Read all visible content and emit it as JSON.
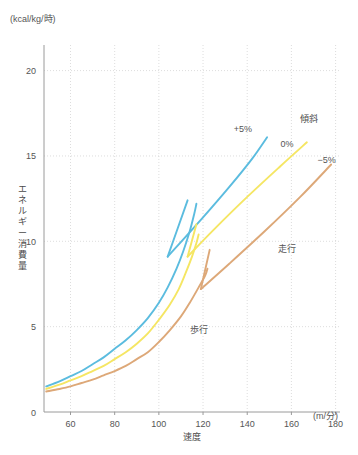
{
  "chart_data": {
    "type": "line",
    "title": "",
    "xlabel": "速度",
    "ylabel": "エネルギー消費量",
    "x_unit": "(m/分)",
    "y_unit": "(kcal/kg/時)",
    "xlim": [
      48,
      182
    ],
    "ylim": [
      0,
      21.5
    ],
    "xticks": [
      60,
      80,
      100,
      120,
      140,
      160,
      180
    ],
    "yticks": [
      0,
      5,
      10,
      15,
      20
    ],
    "grid": true,
    "legend_position": "in-plot",
    "group_label": "傾斜",
    "annotations": [
      {
        "text": "歩行",
        "x": 118,
        "y": 4.6
      },
      {
        "text": "走行",
        "x": 158,
        "y": 9.4
      },
      {
        "text": "傾斜",
        "x": 168,
        "y": 17.0
      },
      {
        "text": "+5%",
        "x": 138,
        "y": 16.4
      },
      {
        "text": "0%",
        "x": 158,
        "y": 15.5
      },
      {
        "text": "−5%",
        "x": 176,
        "y": 14.6
      }
    ],
    "series": [
      {
        "name": "+5%",
        "incline": "+5%",
        "color": "#5bbcdf",
        "walk": {
          "label": "歩行",
          "x": [
            49,
            55,
            60,
            65,
            70,
            75,
            80,
            85,
            90,
            95,
            100,
            104,
            108,
            111,
            114,
            116,
            117
          ],
          "y": [
            1.5,
            1.8,
            2.1,
            2.4,
            2.8,
            3.2,
            3.7,
            4.2,
            4.8,
            5.5,
            6.4,
            7.3,
            8.4,
            9.4,
            10.6,
            11.6,
            12.2
          ]
        },
        "run": {
          "label": "走行",
          "x": [
            104,
            120,
            132,
            142,
            149
          ],
          "y": [
            9.1,
            11.4,
            13.2,
            14.8,
            16.1
          ]
        }
      },
      {
        "name": "0%",
        "incline": "0%",
        "color": "#f5e663",
        "walk": {
          "label": "歩行",
          "x": [
            49,
            55,
            60,
            65,
            70,
            75,
            80,
            85,
            90,
            95,
            100,
            105,
            109,
            112,
            115,
            117,
            118
          ],
          "y": [
            1.35,
            1.6,
            1.85,
            2.1,
            2.4,
            2.7,
            3.1,
            3.5,
            4.0,
            4.6,
            5.4,
            6.3,
            7.2,
            8.1,
            9.1,
            9.9,
            10.4
          ]
        },
        "run": {
          "label": "走行",
          "x": [
            113,
            125,
            140,
            155,
            167
          ],
          "y": [
            9.1,
            10.7,
            12.6,
            14.4,
            15.8
          ]
        }
      },
      {
        "name": "-5%",
        "incline": "−5%",
        "color": "#dda878",
        "walk": {
          "label": "歩行",
          "x": [
            49,
            55,
            60,
            65,
            70,
            75,
            80,
            85,
            90,
            95,
            100,
            105,
            110,
            114,
            118,
            121,
            122
          ],
          "y": [
            1.2,
            1.35,
            1.5,
            1.7,
            1.9,
            2.15,
            2.4,
            2.7,
            3.1,
            3.5,
            4.1,
            4.8,
            5.6,
            6.4,
            7.3,
            8.0,
            8.4
          ]
        },
        "run": {
          "label": "走行",
          "x": [
            119,
            132,
            148,
            164,
            178
          ],
          "y": [
            7.2,
            8.7,
            10.6,
            12.6,
            14.5
          ]
        }
      }
    ],
    "jump_segments": [
      {
        "series": "+5%",
        "color": "#5bbcdf",
        "x": [
          104,
          113
        ],
        "y": [
          9.1,
          12.4
        ]
      },
      {
        "series": "0%",
        "color": "#f5e663",
        "x": [
          113,
          117
        ],
        "y": [
          9.1,
          11.0
        ]
      },
      {
        "series": "-5%",
        "color": "#dda878",
        "x": [
          119,
          123
        ],
        "y": [
          7.2,
          9.5
        ]
      }
    ]
  }
}
